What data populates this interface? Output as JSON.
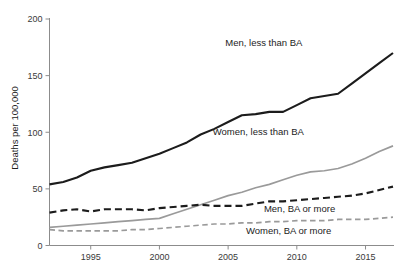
{
  "chart_data": {
    "type": "line",
    "title": "",
    "subtitle": "",
    "xlabel": "",
    "ylabel": "Deaths per 100,000",
    "xlim": [
      1992,
      2017
    ],
    "ylim": [
      0,
      200
    ],
    "grid": false,
    "legend_position": "inline-right",
    "xticks": [
      1995,
      2000,
      2005,
      2010,
      2015
    ],
    "xtick_labels": [
      "1995",
      "2000",
      "2005",
      "2010",
      "2015"
    ],
    "yticks": [
      0,
      50,
      100,
      150,
      200
    ],
    "ytick_labels": [
      "0",
      "50",
      "100",
      "150",
      "200"
    ],
    "x": [
      1992,
      1993,
      1994,
      1995,
      1996,
      1997,
      1998,
      1999,
      2000,
      2001,
      2002,
      2003,
      2004,
      2005,
      2006,
      2007,
      2008,
      2009,
      2010,
      2011,
      2012,
      2013,
      2014,
      2015,
      2016,
      2017
    ],
    "series": [
      {
        "name": "Men, less than BA",
        "color": "#1c1c1c",
        "style": "solid",
        "width": 2.1,
        "label_x": 2007.6,
        "label_y": 176,
        "values": [
          54,
          56,
          60,
          66,
          69,
          71,
          73,
          77,
          81,
          86,
          91,
          98,
          103,
          109,
          115,
          116,
          118,
          118,
          124,
          130,
          132,
          134,
          143,
          152,
          161,
          170
        ]
      },
      {
        "name": "Women, less than BA",
        "color": "#9a9a9a",
        "style": "solid",
        "width": 1.7,
        "label_x": 2007.2,
        "label_y": 98,
        "values": [
          16,
          17,
          18,
          19,
          20,
          21,
          22,
          23,
          24,
          28,
          32,
          36,
          40,
          44,
          47,
          51,
          54,
          58,
          62,
          65,
          66,
          68,
          72,
          77,
          83,
          88
        ]
      },
      {
        "name": "Men, BA or more",
        "color": "#1c1c1c",
        "style": "dashed",
        "width": 2.1,
        "label_x": 2010.2,
        "label_y": 30,
        "values": [
          29,
          31,
          32,
          30,
          32,
          32,
          32,
          31,
          33,
          34,
          35,
          36,
          35,
          35,
          35,
          37,
          39,
          39,
          40,
          41,
          42,
          43,
          44,
          46,
          49,
          52
        ]
      },
      {
        "name": "Women, BA or more",
        "color": "#9a9a9a",
        "style": "dashed",
        "width": 1.7,
        "label_x": 2009.4,
        "label_y": 10,
        "values": [
          14,
          13,
          13,
          13,
          13,
          13,
          14,
          14,
          15,
          16,
          17,
          18,
          19,
          19,
          20,
          20,
          21,
          21,
          22,
          22,
          22,
          23,
          23,
          23,
          24,
          25
        ]
      }
    ]
  },
  "axes": {
    "y_axis_title": "Deaths per 100,000"
  }
}
